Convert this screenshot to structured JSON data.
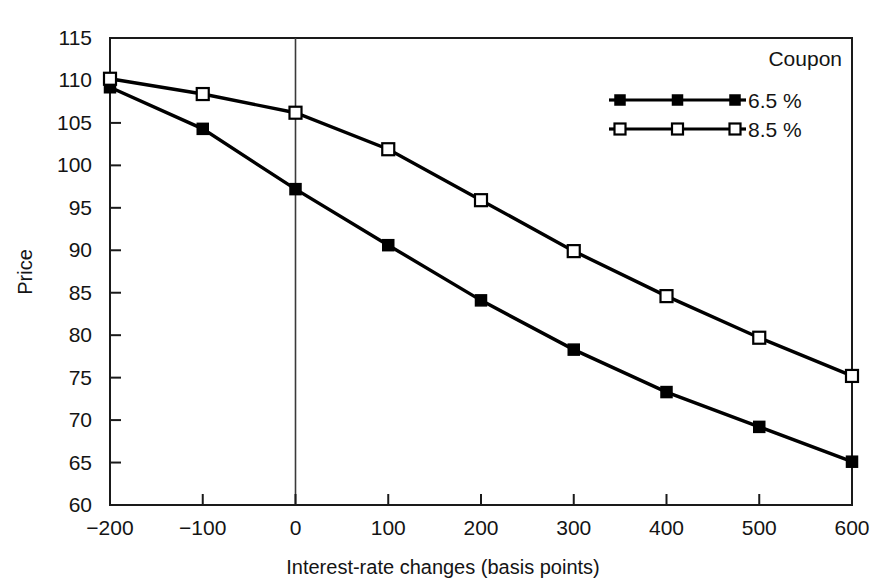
{
  "chart_data": {
    "type": "line",
    "title": "",
    "xlabel": "Interest-rate changes (basis points)",
    "ylabel": "Price",
    "x": [
      -200,
      -100,
      0,
      100,
      200,
      300,
      400,
      500,
      600
    ],
    "xticklabels": [
      "−200",
      "−100",
      "0",
      "100",
      "200",
      "300",
      "400",
      "500",
      "600"
    ],
    "yticklabels": [
      "60",
      "65",
      "70",
      "75",
      "80",
      "85",
      "90",
      "95",
      "100",
      "105",
      "110",
      "115"
    ],
    "yticks": [
      60,
      65,
      70,
      75,
      80,
      85,
      90,
      95,
      100,
      105,
      110,
      115
    ],
    "xlim": [
      -200,
      600
    ],
    "ylim": [
      60,
      115
    ],
    "grid": false,
    "legend_position": "top-right",
    "legend_title": "Coupon",
    "series": [
      {
        "name": "6.5 %",
        "marker": "filled-square",
        "values": [
          109.2,
          104.3,
          97.2,
          90.6,
          84.1,
          78.3,
          73.3,
          69.2,
          65.1
        ]
      },
      {
        "name": "8.5 %",
        "marker": "open-square",
        "values": [
          110.2,
          108.4,
          106.2,
          101.9,
          95.9,
          89.9,
          84.6,
          79.7,
          75.2
        ]
      }
    ],
    "annotations": [
      {
        "name": "zero-reference-line",
        "x": 0
      }
    ]
  }
}
